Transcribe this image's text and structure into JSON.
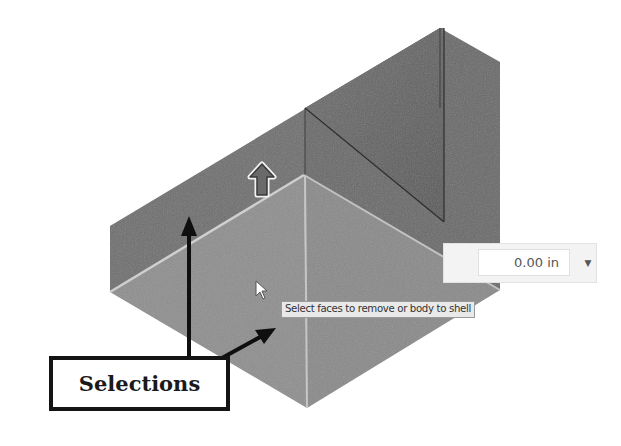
{
  "viewport": {
    "model": "shell-body-solid",
    "colors": {
      "background": "#ffffff",
      "dark_face": "#6f6f6f",
      "inner_face": "#666666",
      "selected_face": "#8e8e8e",
      "selected_face_right": "#8a8a8a",
      "highlight_edge": "#c8c8c8",
      "callout_stroke": "#141414"
    }
  },
  "thickness_input": {
    "value": "0.00 in",
    "dropdown_icon": "triangle-down"
  },
  "tooltip": {
    "text": "Select faces to remove or body to shell"
  },
  "direction_manipulator": {
    "icon": "arrow-up"
  },
  "callout": {
    "label": "Selections"
  },
  "cursor": {
    "icon": "pointer-arrow"
  }
}
